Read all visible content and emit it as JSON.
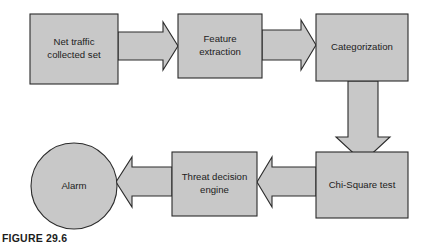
{
  "figure": {
    "caption": "FIGURE 29.6",
    "width": 421,
    "height": 250,
    "background_color": "#ffffff",
    "node_fill_color": "#c8c8c8",
    "node_stroke_color": "#2b2b2b",
    "arrow_fill_color": "#c8c8c8",
    "text_color": "#1c1c1c"
  },
  "nodes": [
    {
      "id": "net-traffic",
      "shape": "rectangle",
      "label_line1": "Net traffic",
      "label_line2": "collected set",
      "x": 30,
      "y": 14,
      "w": 88,
      "h": 70
    },
    {
      "id": "feature-extraction",
      "shape": "rectangle",
      "label_line1": "Feature",
      "label_line2": "extraction",
      "x": 178,
      "y": 14,
      "w": 84,
      "h": 64
    },
    {
      "id": "categorization",
      "shape": "rectangle",
      "label_line1": "Categorization",
      "label_line2": "",
      "x": 316,
      "y": 14,
      "w": 92,
      "h": 67
    },
    {
      "id": "chi-square-test",
      "shape": "rectangle",
      "label_line1": "Chi-Square test",
      "label_line2": "",
      "x": 316,
      "y": 152,
      "w": 92,
      "h": 66
    },
    {
      "id": "threat-decision-engine",
      "shape": "rectangle",
      "label_line1": "Threat decision",
      "label_line2": "engine",
      "x": 172,
      "y": 152,
      "w": 85,
      "h": 64
    },
    {
      "id": "alarm",
      "shape": "circle",
      "label_line1": "Alarm",
      "label_line2": "",
      "cx": 74,
      "cy": 186,
      "r": 43
    }
  ],
  "arrows": [
    {
      "id": "arrow-net-traffic-to-feature-extraction",
      "direction": "right",
      "from": "net-traffic",
      "to": "feature-extraction",
      "points": "118,32 163,32 163,22 178,46 163,70 163,60 118,60"
    },
    {
      "id": "arrow-feature-extraction-to-categorization",
      "direction": "right",
      "from": "feature-extraction",
      "to": "categorization",
      "points": "262,30 301,30 301,20 316,45 301,70 301,60 262,60"
    },
    {
      "id": "arrow-categorization-to-chi-square-test",
      "direction": "down",
      "from": "categorization",
      "to": "chi-square-test",
      "points": "348,81 378,81 378,137 390,137 363,162 336,137 348,137"
    },
    {
      "id": "arrow-chi-square-test-to-threat-decision-engine",
      "direction": "left",
      "from": "chi-square-test",
      "to": "threat-decision-engine",
      "points": "316,167 272,167 272,157 257,182 272,207 272,196 316,196"
    },
    {
      "id": "arrow-threat-decision-engine-to-alarm",
      "direction": "left",
      "from": "threat-decision-engine",
      "to": "alarm",
      "points": "172,167 132,167 132,157 116,182 132,207 132,196 172,196"
    }
  ]
}
